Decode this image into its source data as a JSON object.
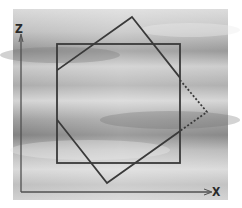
{
  "figure": {
    "type": "diagram",
    "colors": {
      "background_light": "#e6e6e6",
      "background_dark": "#8c8c8c",
      "stroke": "#3a3a3a",
      "axis": "#505050"
    },
    "axes": {
      "vertical_label": "Z",
      "horizontal_label": "X"
    },
    "shapes": {
      "square": {
        "left": 57,
        "top": 44,
        "right": 180,
        "bottom": 163
      },
      "rotated_square": {
        "vertices": [
          [
            132,
            17
          ],
          [
            207,
            112
          ],
          [
            107,
            183
          ],
          [
            57,
            119
          ],
          [
            57,
            71
          ]
        ],
        "dotted_segment": [
          [
            180,
            80
          ],
          [
            207,
            112
          ],
          [
            180,
            131
          ]
        ]
      }
    }
  }
}
